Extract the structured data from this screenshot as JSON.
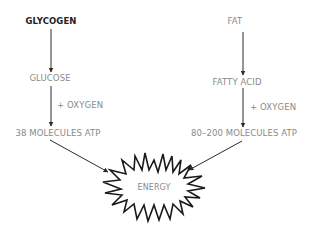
{
  "diagram": {
    "type": "flow",
    "left_chain": {
      "source": "GLYCOGEN",
      "intermediate": "GLUCOSE",
      "reagent": "+ OXYGEN",
      "yield": "38 MOLECULES ATP"
    },
    "right_chain": {
      "source": "FAT",
      "intermediate": "FATTY ACID",
      "reagent": "+ OXYGEN",
      "yield": "80–200 MOLECULES ATP"
    },
    "output": "ENERGY",
    "colors": {
      "source_text": "#222222",
      "secondary_text": "#8a8a8a",
      "lines": "#2a2a2a",
      "background": "#ffffff"
    }
  }
}
